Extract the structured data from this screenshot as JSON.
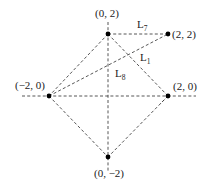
{
  "diagram": {
    "points": [
      {
        "id": "top",
        "label": "(0, 2)",
        "x": 0,
        "y": 2
      },
      {
        "id": "topright",
        "label": "(2, 2)",
        "x": 2,
        "y": 2
      },
      {
        "id": "left",
        "label": "(−2, 0)",
        "x": -2,
        "y": 0
      },
      {
        "id": "right",
        "label": "(2, 0)",
        "x": 2,
        "y": 0
      },
      {
        "id": "bottom",
        "label": "(0, −2)",
        "x": 0,
        "y": -2
      }
    ],
    "lines": [
      {
        "name": "L",
        "sub": "7",
        "from": "top",
        "to": "topright"
      },
      {
        "name": "L",
        "sub": "1",
        "from": "top",
        "to": "right"
      },
      {
        "name": "L",
        "sub": "8",
        "from": "left",
        "to": "topright"
      }
    ],
    "axes": {
      "horizontal": "dashed",
      "vertical": "dashed"
    }
  }
}
